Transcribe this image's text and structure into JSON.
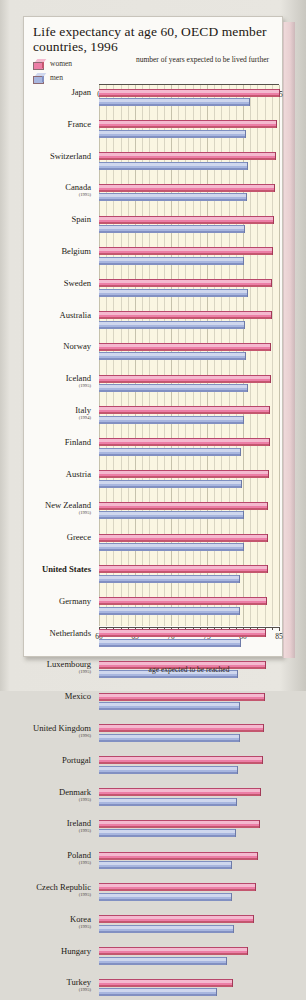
{
  "chart": {
    "title": "Life expectancy at age 60, OECD member countries, 1996",
    "top_axis_caption": "number of years expected to be lived further",
    "bottom_axis_caption": "age expected to be reached",
    "legend": [
      {
        "key": "women",
        "label": "women",
        "color": "#ec7ea6"
      },
      {
        "key": "men",
        "label": "men",
        "color": "#a8b6df"
      }
    ],
    "top_ticks": [
      "0",
      "5",
      "10",
      "15",
      "20",
      "25"
    ],
    "bottom_ticks": [
      "60",
      "65",
      "70",
      "75",
      "80",
      "85"
    ]
  },
  "chart_data": {
    "type": "bar",
    "orientation": "horizontal",
    "title": "Life expectancy at age 60, OECD member countries, 1996",
    "xlabel": "age expected to be reached",
    "xlabel_top": "number of years expected to be lived further",
    "xlim": [
      60,
      85
    ],
    "xlim_top": [
      0,
      25
    ],
    "grid": true,
    "legend_position": "top-left",
    "categories": [
      "Japan",
      "France",
      "Switzerland",
      "Canada",
      "Spain",
      "Belgium",
      "Sweden",
      "Australia",
      "Norway",
      "Iceland",
      "Italy",
      "Finland",
      "Austria",
      "New Zealand",
      "Greece",
      "United States",
      "Germany",
      "Netherlands",
      "Luxembourg",
      "Mexico",
      "United Kingdom",
      "Portugal",
      "Denmark",
      "Ireland",
      "Poland",
      "Czech Republic",
      "Korea",
      "Hungary",
      "Turkey"
    ],
    "category_years": [
      "",
      "",
      "",
      "(1995)",
      "",
      "",
      "",
      "",
      "",
      "(1995)",
      "(1994)",
      "",
      "",
      "(1995)",
      "",
      "",
      "",
      "",
      "(1995)",
      "",
      "(1996)",
      "",
      "(1995)",
      "(1995)",
      "(1995)",
      "(1995)",
      "(1995)",
      "",
      "(1995)"
    ],
    "series": [
      {
        "name": "women",
        "color": "#ec7ea6",
        "values": [
          85.0,
          84.6,
          84.5,
          84.3,
          84.1,
          84.0,
          83.9,
          83.9,
          83.8,
          83.7,
          83.6,
          83.6,
          83.5,
          83.4,
          83.3,
          83.3,
          83.2,
          83.1,
          83.0,
          82.9,
          82.8,
          82.7,
          82.3,
          82.2,
          81.9,
          81.7,
          81.4,
          80.5,
          78.5
        ]
      },
      {
        "name": "men",
        "color": "#a8b6df",
        "values": [
          80.9,
          80.3,
          80.6,
          80.4,
          80.2,
          80.0,
          80.5,
          80.2,
          80.3,
          80.6,
          80.0,
          79.6,
          79.7,
          80.0,
          80.0,
          79.5,
          79.5,
          79.6,
          79.2,
          79.4,
          79.5,
          79.2,
          79.0,
          78.9,
          78.3,
          78.4,
          78.6,
          77.6,
          76.2
        ]
      }
    ]
  }
}
